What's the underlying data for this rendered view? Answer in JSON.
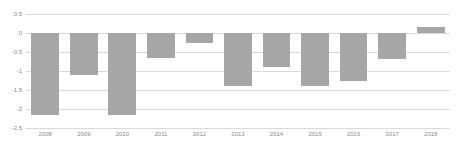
{
  "chart_data": {
    "type": "bar",
    "title": "",
    "subtitle": "",
    "xlabel": "",
    "ylabel": "",
    "categories": [
      "2008",
      "2009",
      "2010",
      "2011",
      "2012",
      "2013",
      "2014",
      "2015",
      "2016",
      "2017",
      "2018"
    ],
    "values": [
      -2.15,
      -1.1,
      -2.15,
      -0.65,
      -0.27,
      -1.4,
      -0.9,
      -1.4,
      -1.25,
      -0.68,
      0.15
    ],
    "series": [
      {
        "name": "",
        "values": [
          -2.15,
          -1.1,
          -2.15,
          -0.65,
          -0.27,
          -1.4,
          -0.9,
          -1.4,
          -1.25,
          -0.68,
          0.15
        ]
      }
    ],
    "ylim": [
      -2.5,
      0.5
    ],
    "yticks": [
      0.5,
      0,
      -0.5,
      -1,
      -1.5,
      -2,
      -2.5
    ],
    "ytick_labels": [
      "0.5",
      "0",
      "-0.5",
      "-1",
      "-1.5",
      "-2",
      "-2.5"
    ],
    "grid": true,
    "legend": false,
    "legend_position": "none",
    "bar_color": "#a6a6a6",
    "gridline_color": "#d9d9d9",
    "axis_label_color": "#8a8a8a",
    "background_color": "#ffffff"
  }
}
